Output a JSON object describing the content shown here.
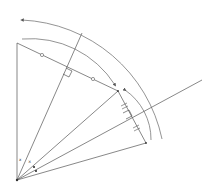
{
  "diagram": {
    "title": "",
    "stroke_color": "#555555",
    "background": "#ffffff",
    "vertex": {
      "x": 17,
      "y": 180
    },
    "points": {
      "A": {
        "x": 17,
        "y": 43
      },
      "B": {
        "x": 118,
        "y": 91
      },
      "C": {
        "x": 146,
        "y": 143
      }
    },
    "rays": [
      {
        "name": "ray-OA",
        "to": {
          "x": 17,
          "y": 43
        }
      },
      {
        "name": "ray-bisector-1",
        "to": {
          "x": 82,
          "y": 33
        }
      },
      {
        "name": "ray-OB",
        "to": {
          "x": 118,
          "y": 91
        }
      },
      {
        "name": "ray-bisector-2",
        "to": {
          "x": 202,
          "y": 80
        }
      },
      {
        "name": "ray-OC",
        "to": {
          "x": 146,
          "y": 143
        }
      }
    ],
    "segments": [
      {
        "name": "segment-AB",
        "from": "A",
        "to": "B",
        "marks": "circles"
      },
      {
        "name": "segment-BC",
        "from": "B",
        "to": "C",
        "marks": "double-ticks"
      }
    ],
    "angle_labels": [
      {
        "text": "x",
        "x": 19,
        "y": 161
      },
      {
        "text": "×",
        "x": 28,
        "y": 163
      }
    ],
    "arcs": [
      {
        "name": "outer-arc",
        "from": {
          "x": 22,
          "y": 20
        },
        "to": {
          "x": 162,
          "y": 139
        }
      },
      {
        "name": "middle-arc",
        "from": {
          "x": 22,
          "y": 39
        },
        "to": {
          "x": 115,
          "y": 85
        }
      },
      {
        "name": "inner-arc",
        "from": {
          "x": 125,
          "y": 90
        },
        "to": {
          "x": 151,
          "y": 140
        }
      }
    ]
  }
}
